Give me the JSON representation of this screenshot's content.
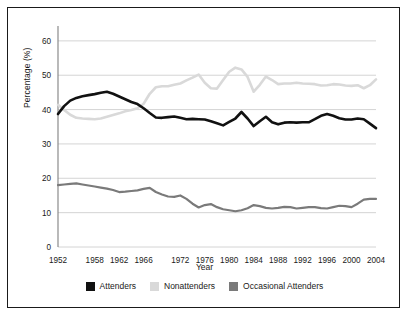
{
  "chart_data": {
    "type": "line",
    "title": "",
    "xlabel": "Year",
    "ylabel": "Percentage (%)",
    "xlim": [
      1952,
      2004
    ],
    "ylim": [
      0,
      62
    ],
    "yticks": [
      0,
      10,
      20,
      30,
      40,
      50,
      60
    ],
    "xticks": [
      1952,
      1958,
      1962,
      1966,
      1972,
      1976,
      1980,
      1984,
      1988,
      1992,
      1996,
      2000,
      2004
    ],
    "xtick_labels": [
      "1952",
      "1958",
      "1962",
      "1966",
      "1972",
      "1976",
      "1980",
      "1984",
      "1988",
      "1992",
      "1996",
      "2000",
      "2004"
    ],
    "ytick_labels": [
      "0",
      "10",
      "20",
      "30",
      "40",
      "50",
      "60"
    ],
    "grid": "horizontal",
    "legend_position": "bottom",
    "x": [
      1952,
      1953,
      1954,
      1955,
      1956,
      1957,
      1958,
      1959,
      1960,
      1961,
      1962,
      1963,
      1964,
      1965,
      1966,
      1967,
      1968,
      1969,
      1970,
      1971,
      1972,
      1973,
      1974,
      1975,
      1976,
      1977,
      1978,
      1979,
      1980,
      1981,
      1982,
      1983,
      1984,
      1985,
      1986,
      1987,
      1988,
      1989,
      1990,
      1991,
      1992,
      1993,
      1994,
      1995,
      1996,
      1997,
      1998,
      1999,
      2000,
      2001,
      2002,
      2003,
      2004
    ],
    "series": [
      {
        "name": "Attenders",
        "color": "#111111",
        "width": 2.6,
        "values": [
          38.7,
          41.0,
          42.6,
          43.4,
          43.9,
          44.2,
          44.5,
          44.9,
          45.2,
          44.6,
          43.8,
          43.0,
          42.2,
          41.6,
          40.4,
          39.0,
          37.7,
          37.6,
          37.8,
          38.0,
          37.6,
          37.2,
          37.3,
          37.2,
          37.1,
          36.6,
          36.0,
          35.4,
          36.4,
          37.4,
          39.3,
          37.4,
          35.2,
          36.6,
          37.9,
          36.3,
          35.7,
          36.2,
          36.3,
          36.2,
          36.3,
          36.3,
          37.2,
          38.2,
          38.7,
          38.2,
          37.5,
          37.1,
          37.1,
          37.4,
          37.2,
          35.9,
          34.6
        ]
      },
      {
        "name": "Nonattenders",
        "color": "#d9d9d9",
        "width": 2.6,
        "values": [
          41.4,
          39.9,
          38.5,
          37.6,
          37.4,
          37.3,
          37.2,
          37.4,
          37.9,
          38.4,
          38.9,
          39.5,
          39.9,
          40.4,
          41.7,
          44.6,
          46.5,
          46.8,
          46.8,
          47.2,
          47.6,
          48.5,
          49.3,
          50.2,
          47.8,
          46.2,
          46.1,
          48.6,
          51.0,
          52.2,
          51.7,
          49.5,
          45.2,
          47.2,
          49.6,
          48.6,
          47.4,
          47.6,
          47.6,
          47.8,
          47.6,
          47.5,
          47.4,
          47.0,
          47.1,
          47.4,
          47.3,
          47.0,
          46.9,
          47.1,
          46.2,
          47.1,
          48.8
        ]
      },
      {
        "name": "Occasional Attenders",
        "color": "#7a7a7a",
        "width": 2.2,
        "values": [
          18.0,
          18.2,
          18.4,
          18.5,
          18.2,
          17.9,
          17.6,
          17.3,
          17.0,
          16.6,
          16.0,
          16.1,
          16.3,
          16.5,
          16.9,
          17.2,
          16.0,
          15.3,
          14.7,
          14.6,
          15.0,
          14.0,
          12.6,
          11.5,
          12.2,
          12.5,
          11.6,
          11.0,
          10.7,
          10.4,
          10.7,
          11.3,
          12.2,
          11.9,
          11.4,
          11.2,
          11.4,
          11.7,
          11.6,
          11.2,
          11.4,
          11.6,
          11.6,
          11.3,
          11.2,
          11.6,
          12.0,
          11.9,
          11.6,
          12.6,
          13.8,
          14.0,
          14.0
        ]
      }
    ],
    "legend": [
      {
        "label": "Attenders",
        "color": "#111111"
      },
      {
        "label": "Nonattenders",
        "color": "#d9d9d9"
      },
      {
        "label": "Occasional Attenders",
        "color": "#7a7a7a"
      }
    ],
    "axis_color": "#999999",
    "grid_color": "#cfcfcf",
    "border_color": "#1a1a1a",
    "background": "#ffffff"
  }
}
